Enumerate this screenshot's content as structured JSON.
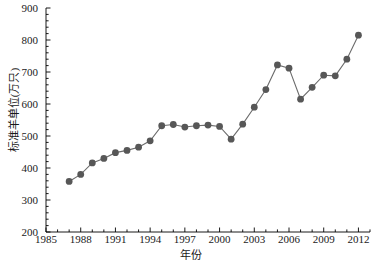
{
  "chart_data": {
    "type": "line",
    "title": "",
    "xlabel": "年份",
    "ylabel": "标准羊单位(万只)",
    "xlim": [
      1985,
      2013
    ],
    "ylim": [
      200,
      900
    ],
    "xticks": [
      1985,
      1988,
      1991,
      1994,
      1997,
      2000,
      2003,
      2006,
      2009,
      2012
    ],
    "yticks": [
      200,
      300,
      400,
      500,
      600,
      700,
      800,
      900
    ],
    "x_minor_tick_step": 1,
    "y_minor_tick_step": 20,
    "grid": false,
    "legend": null,
    "marker": "filled-circle",
    "marker_color": "#575757",
    "line_color": "#6b6b6b",
    "x": [
      1987,
      1988,
      1989,
      1990,
      1991,
      1992,
      1993,
      1994,
      1995,
      1996,
      1997,
      1998,
      1999,
      2000,
      2001,
      2002,
      2003,
      2004,
      2005,
      2006,
      2007,
      2008,
      2009,
      2010,
      2011,
      2012
    ],
    "values": [
      358,
      380,
      416,
      430,
      448,
      455,
      465,
      485,
      532,
      536,
      528,
      532,
      534,
      530,
      490,
      537,
      590,
      645,
      722,
      712,
      615,
      652,
      690,
      688,
      740,
      815
    ],
    "series": [
      {
        "name": "标准羊单位",
        "values": [
          358,
          380,
          416,
          430,
          448,
          455,
          465,
          485,
          532,
          536,
          528,
          532,
          534,
          530,
          490,
          537,
          590,
          645,
          722,
          712,
          615,
          652,
          690,
          688,
          740,
          815
        ]
      }
    ]
  },
  "caption": ""
}
